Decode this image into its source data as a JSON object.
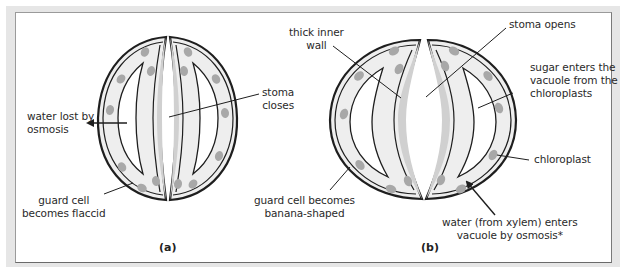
{
  "figure": {
    "panels": [
      {
        "id": "a",
        "caption": "(a)",
        "state": "stoma closed",
        "labels": {
          "water_lost": [
            "water lost by",
            "osmosis"
          ],
          "stoma_closes": [
            "stoma",
            "closes"
          ],
          "guard_cell_flaccid": [
            "guard cell",
            "becomes flaccid"
          ]
        }
      },
      {
        "id": "b",
        "caption": "(b)",
        "state": "stoma open",
        "labels": {
          "thick_inner_wall": [
            "thick inner",
            "wall"
          ],
          "stoma_opens": [
            "stoma opens"
          ],
          "sugar_enters": [
            "sugar enters the",
            "vacuole from the",
            "chloroplasts"
          ],
          "chloroplast": [
            "chloroplast"
          ],
          "water_enters": [
            "water (from xylem) enters",
            "vacuole by osmosis*"
          ],
          "guard_cell_banana": [
            "guard cell becomes",
            "banana-shaped"
          ]
        }
      }
    ],
    "colors": {
      "outline": "#1e1e1e",
      "cytoplasm": "#eeeeee",
      "cell_wall_fill": "#d8d8d8",
      "chloroplast": "#a8a8a8",
      "vacuole": "#ffffff",
      "frame_shadow": "#e6e6e6"
    }
  }
}
